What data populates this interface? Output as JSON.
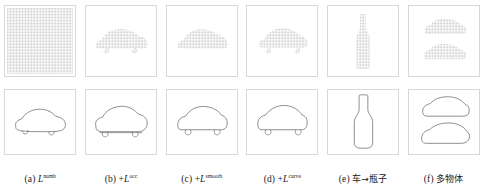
{
  "figure": {
    "panel_border_color": "#d8d8d8",
    "dot_color": "#b9b9bd",
    "outline_color": "#6e6e73",
    "background": "#ffffff",
    "rows": 2,
    "columns": 6,
    "top_row_name": "point-grid-occupancy-row",
    "bottom_row_name": "silhouette-outline-row"
  },
  "captions": [
    {
      "index": "(a)",
      "prefix": "",
      "symbol": "L",
      "superscript": "numb",
      "label_cjk": ""
    },
    {
      "index": "(b)",
      "prefix": "+",
      "symbol": "L",
      "superscript": "occ",
      "label_cjk": ""
    },
    {
      "index": "(c)",
      "prefix": "+",
      "symbol": "L",
      "superscript": "smooth",
      "label_cjk": ""
    },
    {
      "index": "(d)",
      "prefix": "+",
      "symbol": "L",
      "superscript": "curve",
      "label_cjk": ""
    },
    {
      "index": "(e)",
      "prefix": "",
      "symbol": "",
      "superscript": "",
      "label_cjk": "车→瓶子"
    },
    {
      "index": "(f)",
      "prefix": "",
      "symbol": "",
      "superscript": "",
      "label_cjk": "多物体"
    }
  ],
  "panels": {
    "top": [
      {
        "name": "panel-a-top",
        "content": "dense-uniform-dot-grid",
        "shapes": [
          "full-field-grid"
        ]
      },
      {
        "name": "panel-b-top",
        "content": "car-dot-cluster",
        "shapes": [
          "car"
        ]
      },
      {
        "name": "panel-c-top",
        "content": "car-dot-cluster",
        "shapes": [
          "car"
        ]
      },
      {
        "name": "panel-d-top",
        "content": "car-dot-cluster",
        "shapes": [
          "car"
        ]
      },
      {
        "name": "panel-e-top",
        "content": "bottle-dot-cluster",
        "shapes": [
          "bottle"
        ]
      },
      {
        "name": "panel-f-top",
        "content": "two-car-dot-clusters",
        "shapes": [
          "car",
          "car"
        ]
      }
    ],
    "bottom": [
      {
        "name": "panel-a-bottom",
        "content": "car-outline-rough",
        "shapes": [
          "car"
        ]
      },
      {
        "name": "panel-b-bottom",
        "content": "car-outline-rough",
        "shapes": [
          "car"
        ]
      },
      {
        "name": "panel-c-bottom",
        "content": "car-outline-smooth",
        "shapes": [
          "car"
        ]
      },
      {
        "name": "panel-d-bottom",
        "content": "car-outline-smooth",
        "shapes": [
          "car"
        ]
      },
      {
        "name": "panel-e-bottom",
        "content": "bottle-outline",
        "shapes": [
          "bottle"
        ]
      },
      {
        "name": "panel-f-bottom",
        "content": "two-car-outlines",
        "shapes": [
          "car",
          "car"
        ]
      }
    ]
  }
}
